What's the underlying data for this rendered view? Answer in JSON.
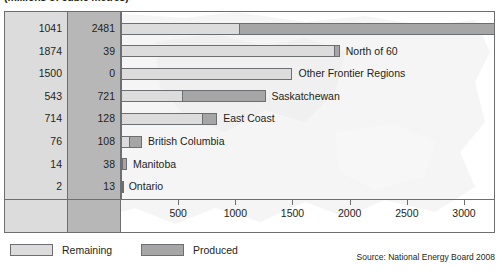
{
  "title": "(millions of cubic metres)",
  "chart_data": {
    "type": "bar",
    "orientation": "horizontal",
    "stacked": true,
    "title": "(millions of cubic metres)",
    "xlabel": "",
    "ylabel": "",
    "xlim": [
      0,
      3700
    ],
    "grid": false,
    "legend_position": "bottom-left",
    "categories": [
      "Alberta",
      "North of 60",
      "Other Frontier Regions",
      "Saskatchewan",
      "East Coast",
      "British Columbia",
      "Manitoba",
      "Ontario"
    ],
    "series": [
      {
        "name": "Remaining",
        "color": "#dcdcdc",
        "values": [
          1041,
          1874,
          1500,
          543,
          714,
          76,
          14,
          2
        ]
      },
      {
        "name": "Produced",
        "color": "#a6a6a6",
        "values": [
          2481,
          39,
          0,
          721,
          128,
          108,
          38,
          13
        ]
      }
    ],
    "totals": [
      3522,
      1913,
      1500,
      1264,
      842,
      184,
      52,
      15
    ],
    "ticks": [
      500,
      1000,
      1500,
      2000,
      2500,
      3000,
      3500
    ],
    "tick_labels": [
      "500",
      "1000",
      "1500",
      "2000",
      "2500",
      "3000",
      "3500"
    ]
  },
  "legend": {
    "remaining_label": "Remaining",
    "produced_label": "Produced"
  },
  "source": "Source: National Energy Board 2008",
  "colors": {
    "remaining": "#dcdcdc",
    "produced": "#a6a6a6",
    "outline": "#6d6e71",
    "col_remaining_bg": "#dcdcdc",
    "col_produced_bg": "#b7b7b7"
  }
}
